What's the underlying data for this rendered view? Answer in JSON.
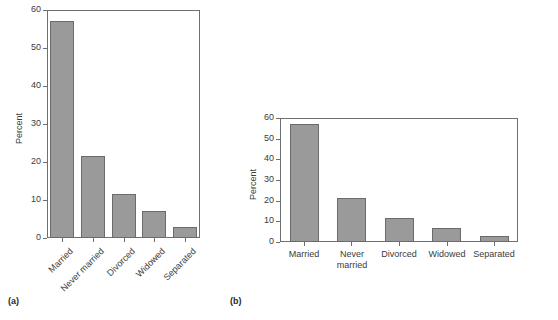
{
  "figure": {
    "panel_a_caption": "(a)",
    "panel_b_caption": "(b)"
  },
  "chart_data": [
    {
      "type": "bar",
      "id": "panel-a",
      "title": "",
      "xlabel": "",
      "ylabel": "Percent",
      "categories": [
        "Married",
        "Never married",
        "Divorced",
        "Widowed",
        "Separated"
      ],
      "values": [
        57.0,
        21.5,
        11.7,
        7.0,
        3.0
      ],
      "ylim": [
        0,
        60
      ],
      "yticks": [
        0,
        10,
        20,
        30,
        40,
        50,
        60
      ],
      "ytick_labels": [
        "0",
        "10",
        "20",
        "30",
        "40",
        "50",
        "60"
      ],
      "grid": false,
      "legend": "none",
      "bar_color": "#9a9a9a",
      "bar_edge_color": "#6b6b6b",
      "xtick_label_rotation": 45,
      "aspect_note": "tall narrow plot area"
    },
    {
      "type": "bar",
      "id": "panel-b",
      "title": "",
      "xlabel": "",
      "ylabel": "Percent",
      "categories": [
        "Married",
        "Never\nmarried",
        "Divorced",
        "Widowed",
        "Separated"
      ],
      "values": [
        57.0,
        21.5,
        11.7,
        7.0,
        3.0
      ],
      "ylim": [
        0,
        60
      ],
      "yticks": [
        0,
        10,
        20,
        30,
        40,
        50,
        60
      ],
      "ytick_labels": [
        "0",
        "10",
        "20",
        "30",
        "40",
        "50",
        "60"
      ],
      "grid": false,
      "legend": "none",
      "bar_color": "#9a9a9a",
      "bar_edge_color": "#6b6b6b",
      "xtick_label_rotation": 0,
      "aspect_note": "wide short plot area"
    }
  ]
}
